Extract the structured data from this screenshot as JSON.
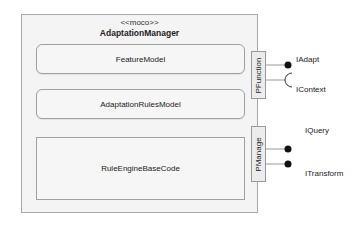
{
  "component": {
    "stereotype": "<<moco>>",
    "name": "AdaptationManager",
    "parts": [
      {
        "name": "FeatureModel"
      },
      {
        "name": "AdaptationRulesModel"
      },
      {
        "name": "RuleEngineBaseCode"
      }
    ]
  },
  "ports": [
    {
      "name": "PFunction",
      "interfaces": [
        {
          "name": "IAdapt",
          "kind": "provided"
        },
        {
          "name": "IContext",
          "kind": "required"
        }
      ]
    },
    {
      "name": "PManage",
      "interfaces": [
        {
          "name": "IQuery",
          "kind": "provided"
        },
        {
          "name": "ITransform",
          "kind": "provided"
        }
      ]
    }
  ],
  "colors": {
    "border": "#a8a8a8",
    "fill": "#f4f4f4",
    "lollipop": "#111111"
  }
}
